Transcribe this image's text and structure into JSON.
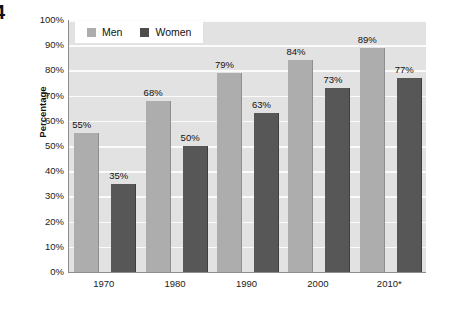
{
  "figure": {
    "marker": "4"
  },
  "legend": {
    "position": "top-left-inside",
    "entries": [
      {
        "label": "Men",
        "color": "#adadad",
        "swatch_name": "legend-swatch-men"
      },
      {
        "label": "Women",
        "color": "#4d4d4d",
        "swatch_name": "legend-swatch-women"
      }
    ]
  },
  "axes": {
    "y_title": "Percentage",
    "y_ticks": [
      "0%",
      "10%",
      "20%",
      "30%",
      "40%",
      "50%",
      "60%",
      "70%",
      "80%",
      "90%",
      "100%"
    ],
    "x_ticks": [
      "1970",
      "1980",
      "1990",
      "2000",
      "2010*"
    ]
  },
  "chart_data": {
    "type": "bar",
    "title": "",
    "subtitle": "",
    "xlabel": "",
    "ylabel": "Percentage",
    "ylim": [
      0,
      100
    ],
    "y_unit": "%",
    "grid": true,
    "legend_position": "top-left",
    "categories": [
      "1970",
      "1980",
      "1990",
      "2000",
      "2010*"
    ],
    "series": [
      {
        "name": "Men",
        "color": "#adadad",
        "values": [
          55,
          68,
          79,
          84,
          89
        ],
        "labels": [
          "55%",
          "68%",
          "79%",
          "84%",
          "89%"
        ]
      },
      {
        "name": "Women",
        "color": "#575757",
        "values": [
          35,
          50,
          63,
          73,
          77
        ],
        "labels": [
          "35%",
          "50%",
          "63%",
          "73%",
          "77%"
        ]
      }
    ],
    "annotations": [
      "* denotes 2010 figure is provisional or projected"
    ]
  }
}
